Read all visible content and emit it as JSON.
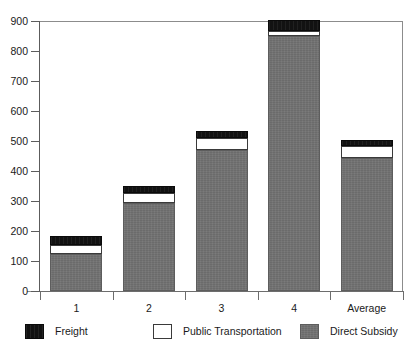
{
  "figure": {
    "title_remnant": "",
    "background_color": "#ffffff"
  },
  "chart_data": {
    "type": "bar",
    "subtype": "stacked-vertical",
    "title": "",
    "subtitle": "",
    "xlabel": "",
    "ylabel": "",
    "categories": [
      "1",
      "2",
      "3",
      "4",
      "Average"
    ],
    "series": [
      {
        "name": "Direct Subsidy",
        "color": "#6b6b6b",
        "values": [
          123,
          293,
          470,
          850,
          443
        ]
      },
      {
        "name": "Public Transportation",
        "color": "#ffffff",
        "values": [
          30,
          34,
          40,
          17,
          40
        ]
      },
      {
        "name": "Freight",
        "color": "#121212",
        "values": [
          30,
          23,
          23,
          36,
          20
        ]
      }
    ],
    "stack_order_bottom_to_top": [
      "Direct Subsidy",
      "Public Transportation",
      "Freight"
    ],
    "totals": [
      183,
      350,
      533,
      903,
      503
    ],
    "ylim": [
      0,
      900
    ],
    "ytick_interval": 100,
    "yticks": [
      0,
      100,
      200,
      300,
      400,
      500,
      600,
      700,
      800,
      900
    ],
    "ytick_labels": [
      "0",
      "100",
      "200",
      "300",
      "400",
      "500",
      "600",
      "700",
      "800",
      "900"
    ],
    "grid": false,
    "legend_position": "bottom",
    "legend_entries": [
      {
        "label": "Freight",
        "color": "#121212"
      },
      {
        "label": "Public Transportation",
        "color": "#ffffff"
      },
      {
        "label": "Direct Subsidy",
        "color": "#6b6b6b"
      }
    ]
  },
  "axes": {
    "y": {
      "labels": [
        "900",
        "800",
        "700",
        "600",
        "500",
        "400",
        "300",
        "200",
        "100",
        "0"
      ]
    },
    "x": {
      "labels": [
        "1",
        "2",
        "3",
        "4",
        "Average"
      ]
    }
  }
}
